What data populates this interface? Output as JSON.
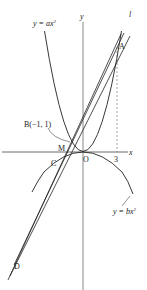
{
  "diagram": {
    "type": "coordinate-geometry",
    "axes": {
      "x_label": "x",
      "y_label": "y",
      "origin_label": "O"
    },
    "curves": [
      {
        "id": "upper",
        "label": "y = ax²",
        "label_prefix": "y = ",
        "label_coef": "ax",
        "label_exp": "2"
      },
      {
        "id": "lower",
        "label": "y = bx²",
        "label_prefix": "y = ",
        "label_coef": "bx",
        "label_exp": "2"
      }
    ],
    "line_label": "l",
    "points": {
      "A": "A",
      "B": "B(−1, 1)",
      "C": "C",
      "D": "D",
      "M": "M",
      "O": "O"
    },
    "tick_label_x": "3"
  }
}
